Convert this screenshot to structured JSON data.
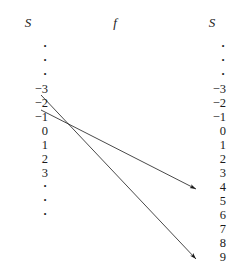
{
  "figure": {
    "type": "function-mapping-diagram",
    "width": 233,
    "height": 279,
    "background": "#ffffff",
    "ink_color": "#1a1a1a"
  },
  "headers": {
    "left": "S",
    "middle": "f",
    "right": "S"
  },
  "columns": {
    "left": {
      "name": "domain-column",
      "items": [
        {
          "kind": "dot",
          "label": "·"
        },
        {
          "kind": "dot",
          "label": "·"
        },
        {
          "kind": "dot",
          "label": "·"
        },
        {
          "kind": "value",
          "label": "−3"
        },
        {
          "kind": "value",
          "label": "−2"
        },
        {
          "kind": "value",
          "label": "−1"
        },
        {
          "kind": "value",
          "label": "0"
        },
        {
          "kind": "value",
          "label": "1"
        },
        {
          "kind": "value",
          "label": "2"
        },
        {
          "kind": "value",
          "label": "3"
        },
        {
          "kind": "dot",
          "label": "·"
        },
        {
          "kind": "dot",
          "label": "·"
        },
        {
          "kind": "dot",
          "label": "·"
        }
      ]
    },
    "right": {
      "name": "codomain-column",
      "items": [
        {
          "kind": "dot",
          "label": "·"
        },
        {
          "kind": "dot",
          "label": "·"
        },
        {
          "kind": "dot",
          "label": "·"
        },
        {
          "kind": "value",
          "label": "−3"
        },
        {
          "kind": "value",
          "label": "−2"
        },
        {
          "kind": "value",
          "label": "−1"
        },
        {
          "kind": "value",
          "label": "0"
        },
        {
          "kind": "value",
          "label": "1"
        },
        {
          "kind": "value",
          "label": "2"
        },
        {
          "kind": "value",
          "label": "3"
        },
        {
          "kind": "value",
          "label": "4"
        },
        {
          "kind": "value",
          "label": "5"
        },
        {
          "kind": "value",
          "label": "6"
        },
        {
          "kind": "value",
          "label": "7"
        },
        {
          "kind": "value",
          "label": "8"
        },
        {
          "kind": "value",
          "label": "9"
        }
      ]
    }
  },
  "arrows": [
    {
      "name": "arrow-minus3-to-9",
      "from_label": "−3",
      "to_label": "9",
      "x1": 41,
      "y1": 95,
      "x2": 196,
      "y2": 259
    },
    {
      "name": "arrow-minus2-to-4",
      "from_label": "−2",
      "to_label": "4",
      "x1": 41,
      "y1": 110,
      "x2": 196,
      "y2": 189
    }
  ]
}
